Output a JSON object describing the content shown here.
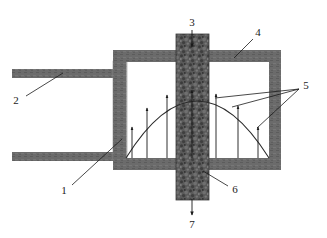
{
  "figure": {
    "type": "patent-cross-section-diagram",
    "background_color": "#ffffff",
    "width": 327,
    "height": 238,
    "colors": {
      "wall_gray": "#6b6b6b",
      "wall_gray_dark": "#5e5e5e",
      "filter_light_gray": "#a8a8a8",
      "column_texture_dark": "#4a4a4a",
      "column_texture_mid": "#6f6f6f",
      "line_black": "#1a1a1a",
      "profile_curve": "#2a2a2a"
    },
    "reference_numerals": [
      {
        "id": "1",
        "label": "1",
        "text_x": 64,
        "text_y": 191,
        "leader_from": [
          72,
          184
        ],
        "leader_to": [
          120,
          140
        ],
        "description": "filter element"
      },
      {
        "id": "2",
        "label": "2",
        "text_x": 16,
        "text_y": 101,
        "leader_from": [
          26,
          96
        ],
        "leader_to": [
          62,
          73
        ],
        "description": "inlet duct wall"
      },
      {
        "id": "3",
        "label": "3",
        "text_x": 189,
        "text_y": 24,
        "leader_from": [
          192,
          28
        ],
        "leader_to": [
          192,
          47
        ],
        "description": "upper column inlet",
        "arrow": true,
        "arrow_direction": "down"
      },
      {
        "id": "4",
        "label": "4",
        "text_x": 256,
        "text_y": 35,
        "leader_from": [
          254,
          39
        ],
        "leader_to": [
          235,
          58
        ],
        "description": "chamber housing wall"
      },
      {
        "id": "5",
        "label": "5",
        "text_x": 304,
        "text_y": 88,
        "leader_from": [
          300,
          90
        ],
        "leader_targets": [
          [
            215,
            97
          ],
          [
            232,
            106
          ],
          [
            258,
            117
          ]
        ],
        "description": "velocity profile arrows"
      },
      {
        "id": "6",
        "label": "6",
        "text_x": 233,
        "text_y": 191,
        "leader_from": [
          228,
          186
        ],
        "leader_to": [
          203,
          172
        ],
        "description": "packed column body"
      },
      {
        "id": "7",
        "label": "7",
        "text_x": 189,
        "text_y": 225,
        "leader_from": [
          192,
          215
        ],
        "leader_to": [
          192,
          196
        ],
        "description": "lower column outlet",
        "arrow": true,
        "arrow_direction": "down"
      }
    ],
    "geometry": {
      "chamber": {
        "left": 113,
        "right": 281,
        "top": 50,
        "bottom": 170,
        "wall_thickness": 12
      },
      "inlet_ducts": [
        {
          "x": 12,
          "y": 69,
          "width": 105,
          "height": 9
        },
        {
          "x": 12,
          "y": 152,
          "width": 105,
          "height": 9
        }
      ],
      "filter_element": {
        "x": 113,
        "y": 62,
        "width": 13,
        "height": 96
      },
      "center_column": {
        "x": 176,
        "y": 34,
        "width": 33,
        "height": 166
      }
    },
    "velocity_profile": {
      "baseline_y": 158,
      "peak_y": 91,
      "curve_left_x": 126,
      "curve_right_x": 269,
      "arrows": [
        {
          "x": 132,
          "top_y": 127
        },
        {
          "x": 146,
          "top_y": 108
        },
        {
          "x": 167,
          "top_y": 94
        },
        {
          "x": 192,
          "top_y": 90
        },
        {
          "x": 216,
          "top_y": 93
        },
        {
          "x": 238,
          "top_y": 105
        },
        {
          "x": 258,
          "top_y": 126
        }
      ]
    }
  }
}
